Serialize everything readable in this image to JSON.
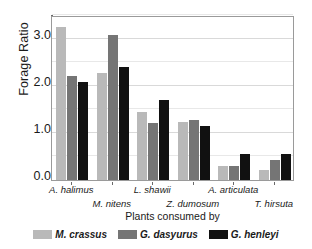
{
  "chart_data": {
    "type": "bar",
    "title": "",
    "xlabel": "Plants consumed by",
    "ylabel": "Forage Ratio",
    "categories": [
      "A. halimus",
      "M. nitens",
      "L. shawii",
      "Z. dumosum",
      "A. articulata",
      "T. hirsuta"
    ],
    "series": [
      {
        "name": "M. crassus",
        "color": "#b9b9b9",
        "values": [
          3.25,
          2.28,
          1.44,
          1.23,
          0.29,
          0.22
        ]
      },
      {
        "name": "G. dasyurus",
        "color": "#757575",
        "values": [
          2.21,
          3.08,
          1.22,
          1.27,
          0.29,
          0.42
        ]
      },
      {
        "name": "G. henleyi",
        "color": "#111111",
        "values": [
          2.07,
          2.4,
          1.69,
          1.15,
          0.55,
          0.55
        ]
      }
    ],
    "ylim": [
      0.0,
      3.5
    ],
    "yticks": [
      0.0,
      1.0,
      2.0,
      3.0
    ],
    "ytick_labels": [
      "0.0",
      "1.0",
      "2.0",
      "3.0"
    ],
    "yticks_minor": [
      0.5,
      1.5,
      2.5,
      3.5
    ],
    "grid": true,
    "legend_position": "bottom"
  },
  "axes": {
    "y_title": "Forage Ratio",
    "x_title": "Plants consumed by"
  },
  "legend": {
    "items": [
      {
        "label": "M. crassus"
      },
      {
        "label": "G. dasyurus"
      },
      {
        "label": "G. henleyi"
      }
    ]
  }
}
